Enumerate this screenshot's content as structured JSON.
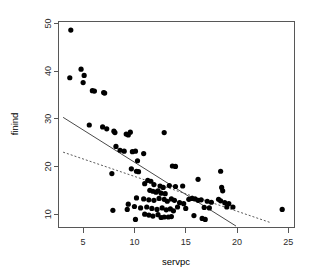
{
  "chart_data": {
    "type": "scatter",
    "title": "",
    "subtitle": "",
    "xlabel": "servpc",
    "ylabel": "finind",
    "xlim": [
      2.6,
      25.6
    ],
    "ylim": [
      7.2,
      50.4
    ],
    "xticks": [
      5,
      10,
      15,
      20,
      25
    ],
    "yticks": [
      10,
      20,
      30,
      40,
      50
    ],
    "xtick_labels": [
      "5",
      "10",
      "15",
      "20",
      "25"
    ],
    "ytick_labels": [
      "10",
      "20",
      "30",
      "40",
      "50"
    ],
    "grid": false,
    "legend": "none",
    "point_color": "#000000",
    "point_size": 2.6,
    "frame_color": "#575757",
    "points": [
      [
        3.8,
        48.6
      ],
      [
        3.7,
        38.6
      ],
      [
        4.8,
        40.4
      ],
      [
        5.1,
        39.1
      ],
      [
        5.0,
        37.6
      ],
      [
        5.9,
        35.9
      ],
      [
        6.1,
        35.8
      ],
      [
        7.0,
        35.5
      ],
      [
        7.1,
        35.4
      ],
      [
        5.6,
        28.7
      ],
      [
        6.9,
        28.3
      ],
      [
        7.3,
        27.9
      ],
      [
        8.0,
        27.4
      ],
      [
        8.1,
        27.1
      ],
      [
        9.2,
        26.8
      ],
      [
        9.4,
        26.6
      ],
      [
        9.6,
        27.2
      ],
      [
        12.9,
        27.1
      ],
      [
        8.2,
        24.2
      ],
      [
        8.6,
        23.4
      ],
      [
        9.0,
        23.2
      ],
      [
        9.8,
        23.1
      ],
      [
        10.1,
        23.2
      ],
      [
        10.9,
        22.7
      ],
      [
        10.3,
        21.2
      ],
      [
        9.7,
        19.5
      ],
      [
        10.2,
        19.0
      ],
      [
        10.4,
        18.9
      ],
      [
        7.8,
        18.5
      ],
      [
        13.7,
        20.1
      ],
      [
        14.0,
        20.0
      ],
      [
        18.4,
        19.0
      ],
      [
        16.2,
        17.3
      ],
      [
        11.3,
        17.1
      ],
      [
        11.6,
        16.9
      ],
      [
        11.0,
        16.4
      ],
      [
        11.9,
        16.2
      ],
      [
        12.5,
        15.9
      ],
      [
        12.8,
        15.6
      ],
      [
        14.7,
        15.9
      ],
      [
        11.5,
        15.0
      ],
      [
        11.8,
        14.8
      ],
      [
        12.1,
        14.6
      ],
      [
        12.3,
        14.9
      ],
      [
        12.6,
        14.4
      ],
      [
        13.0,
        14.3
      ],
      [
        18.5,
        15.6
      ],
      [
        18.6,
        14.9
      ],
      [
        10.2,
        13.4
      ],
      [
        10.9,
        13.2
      ],
      [
        11.4,
        13.0
      ],
      [
        11.9,
        12.9
      ],
      [
        12.4,
        13.3
      ],
      [
        12.9,
        13.1
      ],
      [
        13.2,
        12.7
      ],
      [
        13.6,
        13.2
      ],
      [
        13.9,
        12.9
      ],
      [
        15.3,
        13.1
      ],
      [
        15.6,
        13.3
      ],
      [
        15.9,
        13.2
      ],
      [
        16.2,
        12.9
      ],
      [
        16.5,
        13.0
      ],
      [
        17.1,
        12.7
      ],
      [
        17.5,
        12.5
      ],
      [
        18.2,
        13.1
      ],
      [
        18.4,
        12.8
      ],
      [
        18.8,
        12.4
      ],
      [
        19.2,
        12.2
      ],
      [
        9.4,
        12.1
      ],
      [
        10.0,
        11.6
      ],
      [
        10.6,
        11.3
      ],
      [
        11.2,
        11.5
      ],
      [
        11.7,
        11.2
      ],
      [
        12.2,
        11.0
      ],
      [
        12.7,
        11.3
      ],
      [
        13.1,
        10.9
      ],
      [
        13.5,
        11.1
      ],
      [
        13.8,
        10.7
      ],
      [
        14.2,
        11.5
      ],
      [
        15.0,
        11.2
      ],
      [
        16.8,
        11.4
      ],
      [
        17.3,
        11.3
      ],
      [
        19.0,
        11.5
      ],
      [
        19.6,
        11.5
      ],
      [
        24.4,
        11.0
      ],
      [
        7.9,
        10.8
      ],
      [
        9.3,
        11.0
      ],
      [
        11.0,
        10.0
      ],
      [
        11.4,
        9.8
      ],
      [
        11.8,
        9.6
      ],
      [
        12.3,
        9.9
      ],
      [
        12.6,
        9.3
      ],
      [
        12.9,
        9.4
      ],
      [
        13.3,
        9.4
      ],
      [
        13.6,
        9.5
      ],
      [
        10.1,
        8.9
      ],
      [
        15.8,
        9.7
      ],
      [
        16.6,
        9.1
      ],
      [
        16.9,
        8.9
      ],
      [
        14.4,
        12.4
      ],
      [
        14.8,
        12.2
      ],
      [
        13.4,
        16.0
      ],
      [
        14.0,
        15.8
      ]
    ],
    "series": [
      {
        "name": "ols-fit",
        "style": "solid",
        "color": "#4a4a4a",
        "endpoints": [
          [
            3.05,
            30.3
          ],
          [
            19.9,
            7.5
          ]
        ]
      },
      {
        "name": "robust-fit",
        "style": "dashed",
        "color": "#5a5a5a",
        "endpoints": [
          [
            3.05,
            23.0
          ],
          [
            23.3,
            8.2
          ]
        ]
      }
    ]
  }
}
